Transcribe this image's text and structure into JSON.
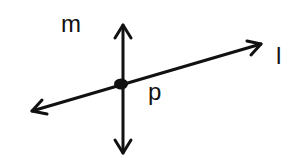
{
  "diagram": {
    "type": "geometry-intersecting-lines",
    "lines": [
      {
        "name": "m",
        "label": "m",
        "orientation": "vertical",
        "arrows": "both"
      },
      {
        "name": "l",
        "label": "l",
        "orientation": "slanted",
        "arrows": "both"
      }
    ],
    "points": [
      {
        "name": "p",
        "label": "p",
        "description": "intersection of lines m and l"
      }
    ],
    "colors": {
      "stroke": "#111111",
      "background": "#ffffff"
    }
  }
}
